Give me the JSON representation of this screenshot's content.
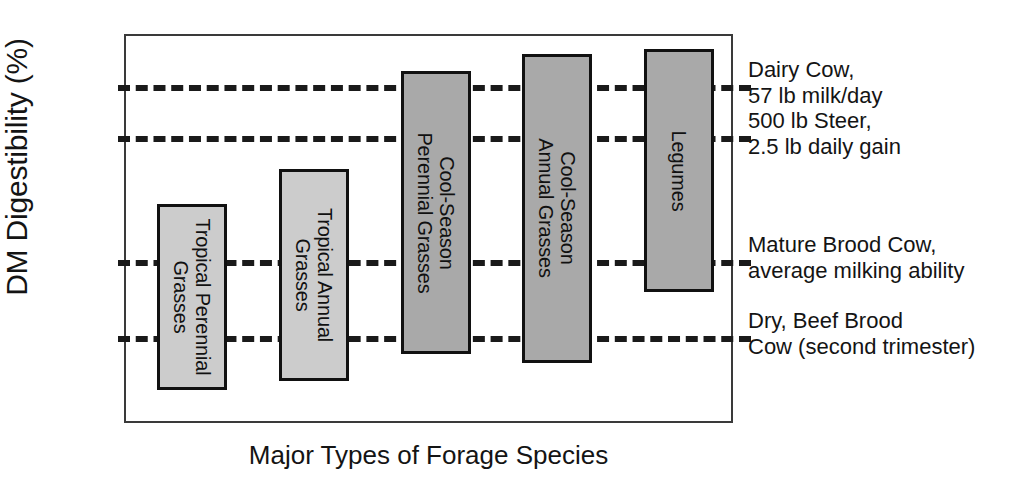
{
  "chart_data": {
    "type": "bar",
    "title": "",
    "subtitle": "",
    "xlabel": "Major Types of Forage Species",
    "ylabel": "DM Digestibility (%)",
    "ylim": [
      40,
      84
    ],
    "yticks": [
      40,
      50,
      60,
      70,
      80
    ],
    "ytick_labels": [
      "40",
      "50",
      "60",
      "70",
      "80"
    ],
    "grid": false,
    "legend": "none",
    "categories": [
      "Tropical Perennial Grasses",
      "Tropical Annual Grasses",
      "Cool-Season Perennial Grasses",
      "Cool-Season Annual Grasses",
      "Legumes"
    ],
    "series": [
      {
        "name": "Minimum DM Digestibility (%)",
        "values": [
          44,
          45,
          48,
          47,
          55
        ]
      },
      {
        "name": "Maximum DM Digestibility (%)",
        "values": [
          65,
          69,
          80,
          82,
          82.5
        ]
      }
    ],
    "bars": [
      {
        "label": "Tropical Perennial\nGrasses",
        "low": 44,
        "high": 65,
        "fill": "#cccccc"
      },
      {
        "label": "Tropical Annual\nGrasses",
        "low": 45,
        "high": 69,
        "fill": "#cccccc"
      },
      {
        "label": "Cool-Season\nPerennial Grasses",
        "low": 48,
        "high": 80,
        "fill": "#a9a9a9"
      },
      {
        "label": "Cool-Season\nAnnual Grasses",
        "low": 47,
        "high": 82,
        "fill": "#a9a9a9"
      },
      {
        "label": "Legumes",
        "low": 55,
        "high": 82.5,
        "fill": "#a9a9a9"
      }
    ],
    "reference_lines": [
      {
        "value": 78.5,
        "label": "Dairy Cow,\n57 lb milk/day"
      },
      {
        "value": 72.7,
        "label": "500 lb Steer,\n2.5 lb daily gain"
      },
      {
        "value": 58.7,
        "label": "Mature Brood Cow,\naverage milking ability"
      },
      {
        "value": 50.1,
        "label": "Dry, Beef Brood\nCow (second trimester)"
      }
    ],
    "colors": {
      "bar_light": "#cccccc",
      "bar_dark": "#a9a9a9",
      "bar_outline": "#111111",
      "reference_line": "#1a1a1a",
      "frame": "#3a3a3a",
      "text": "#141414",
      "background": "#ffffff"
    }
  }
}
